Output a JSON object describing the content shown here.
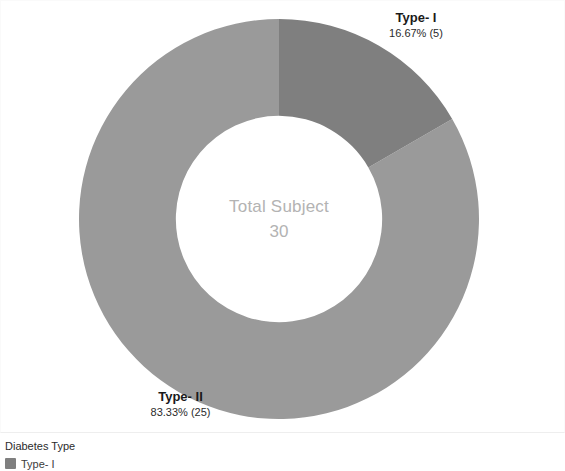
{
  "chart_data": {
    "type": "pie",
    "variant": "donut",
    "title": "",
    "center_label": "Total Subject",
    "center_value": "30",
    "total": 30,
    "start_angle_deg": 0,
    "outer_radius_px": 190,
    "inner_radius_px": 98,
    "categories": [
      "Type- I",
      "Type- II"
    ],
    "values": [
      5,
      25
    ],
    "percents": [
      16.67,
      83.33
    ],
    "value_labels": [
      "16.67% (5)",
      "83.33% (25)"
    ],
    "colors": [
      "#7f7f7f",
      "#9a9a9a"
    ],
    "legend_position": "bottom-left",
    "legend_title": "Diabetes Type",
    "slices": [
      {
        "name": "Type- I",
        "value": 5,
        "percent": 16.67,
        "value_label": "16.67% (5)",
        "color": "#7f7f7f",
        "start_deg": 0,
        "end_deg": 60
      },
      {
        "name": "Type- II",
        "value": 25,
        "percent": 83.33,
        "value_label": "83.33% (25)",
        "color": "#9a9a9a",
        "start_deg": 60,
        "end_deg": 360
      }
    ]
  },
  "labels": {
    "type1_name": "Type- I",
    "type1_value": "16.67% (5)",
    "type2_name": "Type- II",
    "type2_value": "83.33% (25)"
  },
  "center": {
    "title": "Total Subject",
    "value": "30"
  },
  "legend": {
    "title": "Diabetes Type",
    "items": [
      {
        "label": "Type- I",
        "color": "#7f7f7f"
      }
    ]
  }
}
